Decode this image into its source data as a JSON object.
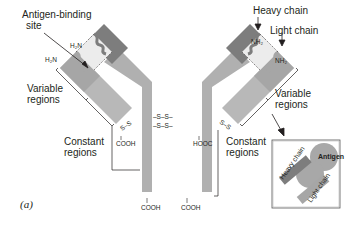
{
  "figure": {
    "panel_label": "(a)",
    "colors": {
      "heavy_variable": "#7d7d7d",
      "light_variable": "#a6a6a6",
      "constant": "#b8b8b8",
      "stem": "#b0b0b0",
      "binding_site": "#ececec",
      "antigen": "#a8a8a8",
      "line": "#231f20"
    }
  },
  "labels": {
    "antigen_binding_site_line1": "Antigen-binding",
    "antigen_binding_site_line2": "site",
    "heavy_chain": "Heavy chain",
    "light_chain": "Light chain",
    "variable_regions_left_line1": "Variable",
    "variable_regions_left_line2": "regions",
    "variable_regions_right_line1": "Variable",
    "variable_regions_right_line2": "regions",
    "constant_regions_left_line1": "Constant",
    "constant_regions_left_line2": "regions",
    "constant_regions_right_line1": "Constant",
    "constant_regions_right_line2": "regions"
  },
  "termini": {
    "left_heavy_n": "H₂N",
    "left_light_n": "H₂N",
    "right_heavy_n": "NH₂",
    "right_light_n": "NH₂",
    "left_light_c": "COOH",
    "right_light_c": "HOOC",
    "left_heavy_c": "COOH",
    "right_heavy_c": "COOH"
  },
  "bonds": {
    "left_interchain": "S–S",
    "right_interchain": "S–S",
    "hinge_top": "–S–S–",
    "hinge_bottom": "–S–S–"
  },
  "inset": {
    "heavy_chain": "Heavy chain",
    "light_chain": "Light chain",
    "antigen": "Antigen"
  }
}
